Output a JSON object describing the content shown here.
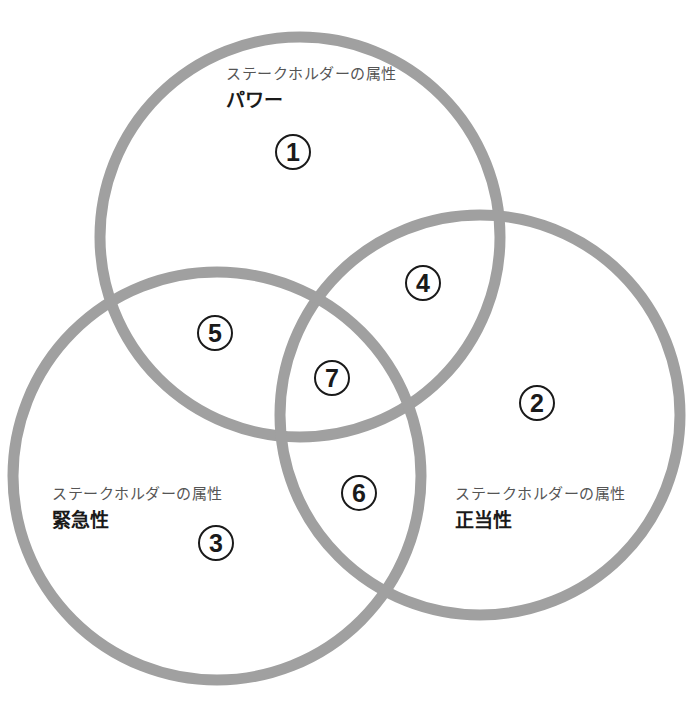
{
  "diagram": {
    "type": "venn",
    "stroke_color": "#a0a0a0",
    "stroke_width": 11,
    "circles": [
      {
        "id": "power",
        "cx": 300,
        "cy": 237,
        "r": 200
      },
      {
        "id": "legitimacy",
        "cx": 480,
        "cy": 415,
        "r": 200
      },
      {
        "id": "urgency",
        "cx": 217,
        "cy": 476,
        "r": 204
      }
    ]
  },
  "attributes": {
    "power": {
      "caption": "ステークホルダーの属性",
      "name": "パワー"
    },
    "urgency": {
      "caption": "ステークホルダーの属性",
      "name": "緊急性"
    },
    "legitimacy": {
      "caption": "ステークホルダーの属性",
      "name": "正当性"
    }
  },
  "regions": [
    {
      "num": "1",
      "x": 293,
      "y": 152
    },
    {
      "num": "2",
      "x": 537,
      "y": 403
    },
    {
      "num": "3",
      "x": 216,
      "y": 543
    },
    {
      "num": "4",
      "x": 423,
      "y": 283
    },
    {
      "num": "5",
      "x": 215,
      "y": 333
    },
    {
      "num": "6",
      "x": 359,
      "y": 493
    },
    {
      "num": "7",
      "x": 332,
      "y": 378
    }
  ]
}
